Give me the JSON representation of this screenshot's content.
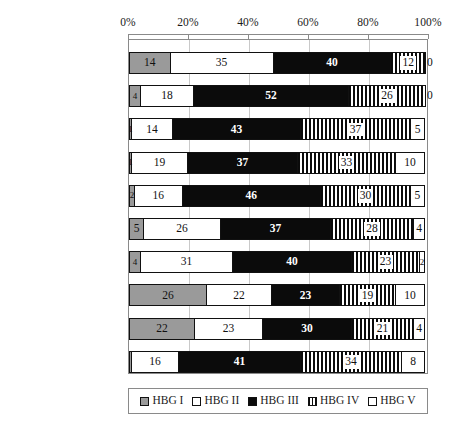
{
  "chart_data": {
    "type": "bar",
    "orientation": "horizontal",
    "stacked": true,
    "normalized_percent": true,
    "title": "",
    "subtitle": "",
    "xlabel": "",
    "ylabel": "",
    "xlim": [
      0,
      100
    ],
    "xticks": [
      "0%",
      "20%",
      "40%",
      "60%",
      "80%",
      "100%"
    ],
    "xtick_values": [
      0,
      20,
      40,
      60,
      80,
      100
    ],
    "grid": true,
    "grid_axis": "x",
    "legend_position": "bottom",
    "categories": [
      "eigene Studie",
      "Bremen",
      "Hamburg",
      "Hessen",
      "Mittelfranken",
      "Niedersachsen",
      "Oberbayern",
      "Rheinland",
      "Westfalen-Lippe",
      "Württemberg-Hohenz."
    ],
    "series": [
      {
        "name": "HBG I",
        "values": [
          14,
          4,
          1,
          1,
          2,
          5,
          4,
          26,
          22,
          1
        ]
      },
      {
        "name": "HBG II",
        "values": [
          35,
          18,
          14,
          19,
          16,
          26,
          31,
          22,
          23,
          16
        ]
      },
      {
        "name": "HBG III",
        "values": [
          40,
          52,
          43,
          37,
          46,
          37,
          40,
          23,
          30,
          41
        ]
      },
      {
        "name": "HBG IV",
        "values": [
          12,
          26,
          37,
          33,
          30,
          28,
          23,
          19,
          21,
          34
        ]
      },
      {
        "name": "HBG V",
        "values": [
          0,
          0,
          5,
          10,
          5,
          4,
          2,
          10,
          4,
          8
        ]
      }
    ]
  },
  "axis": {
    "ticks": [
      "0%",
      "20%",
      "40%",
      "60%",
      "80%",
      "100%"
    ]
  },
  "rows": [
    {
      "label": "eigene Studie",
      "italic": true,
      "values": [
        14,
        35,
        40,
        12,
        0
      ],
      "hide": [
        false,
        false,
        false,
        false,
        false
      ],
      "tiny": [
        false,
        false,
        false,
        false,
        false
      ],
      "outside_last": true
    },
    {
      "label": "Bremen",
      "italic": false,
      "values": [
        4,
        18,
        52,
        26,
        0
      ],
      "hide": [
        false,
        false,
        false,
        false,
        false
      ],
      "tiny": [
        true,
        false,
        false,
        false,
        false
      ],
      "outside_last": true
    },
    {
      "label": "Hamburg",
      "italic": false,
      "values": [
        1,
        14,
        43,
        37,
        5
      ],
      "hide": [
        false,
        false,
        false,
        false,
        false
      ],
      "tiny": [
        true,
        false,
        false,
        false,
        false
      ],
      "outside_last": false
    },
    {
      "label": "Hessen",
      "italic": false,
      "values": [
        1,
        19,
        37,
        33,
        10
      ],
      "hide": [
        false,
        false,
        false,
        false,
        false
      ],
      "tiny": [
        true,
        false,
        false,
        false,
        false
      ],
      "outside_last": false
    },
    {
      "label": "Mittelfranken",
      "italic": false,
      "values": [
        2,
        16,
        46,
        30,
        5
      ],
      "hide": [
        false,
        false,
        false,
        false,
        false
      ],
      "tiny": [
        true,
        false,
        false,
        false,
        false
      ],
      "outside_last": false
    },
    {
      "label": "Niedersachsen",
      "italic": false,
      "values": [
        5,
        26,
        37,
        28,
        4
      ],
      "hide": [
        false,
        false,
        false,
        false,
        false
      ],
      "tiny": [
        false,
        false,
        false,
        false,
        false
      ],
      "outside_last": false
    },
    {
      "label": "Oberbayern",
      "italic": false,
      "values": [
        4,
        31,
        40,
        23,
        2
      ],
      "hide": [
        false,
        false,
        false,
        false,
        false
      ],
      "tiny": [
        true,
        false,
        false,
        false,
        true
      ],
      "outside_last": false
    },
    {
      "label": "Rheinland",
      "italic": false,
      "values": [
        26,
        22,
        23,
        19,
        10
      ],
      "hide": [
        false,
        false,
        false,
        false,
        false
      ],
      "tiny": [
        false,
        false,
        false,
        false,
        false
      ],
      "outside_last": false
    },
    {
      "label": "Westfalen-Lippe",
      "italic": false,
      "values": [
        22,
        23,
        30,
        21,
        4
      ],
      "hide": [
        false,
        false,
        false,
        false,
        false
      ],
      "tiny": [
        false,
        false,
        false,
        false,
        false
      ],
      "outside_last": false
    },
    {
      "label": "Württemberg-Hohenz.",
      "italic": false,
      "values": [
        1,
        16,
        41,
        34,
        8
      ],
      "hide": [
        true,
        false,
        false,
        false,
        false
      ],
      "tiny": [
        true,
        false,
        false,
        false,
        false
      ],
      "outside_last": false
    }
  ],
  "legend": {
    "items": [
      {
        "label": "HBG I",
        "swatch": "gray-swatch"
      },
      {
        "label": "HBG II",
        "swatch": "white-swatch"
      },
      {
        "label": "HBG III",
        "swatch": "black-swatch"
      },
      {
        "label": "HBG IV",
        "swatch": "striped-swatch"
      },
      {
        "label": "HBG V",
        "swatch": "white-swatch"
      }
    ]
  },
  "colors": {
    "hbg1": "#9a9a9a",
    "hbg2": "#ffffff",
    "hbg3": "#0b0b0b",
    "hbg4": "#ffffff",
    "hbg5": "#ffffff",
    "axis": "#8a8a8a",
    "grid": "#c9c9c9",
    "background": "#ffffff"
  }
}
